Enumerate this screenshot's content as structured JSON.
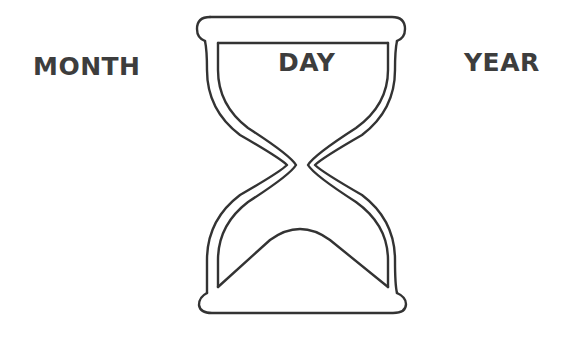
{
  "labels": {
    "left": "MONTH",
    "center": "DAY",
    "right": "YEAR"
  },
  "icon": {
    "name": "hourglass-icon",
    "stroke_color": "#333333",
    "background": "#ffffff"
  }
}
